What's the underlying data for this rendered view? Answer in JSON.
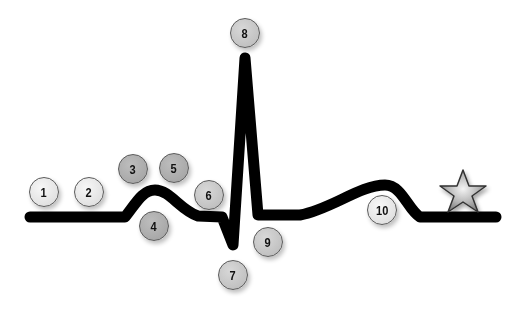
{
  "diagram": {
    "type": "ecg-waveform",
    "line_color": "#000000",
    "background": "#ffffff",
    "end_marker": {
      "icon": "star-icon",
      "fill": "#b8b8b8",
      "stroke": "#333333"
    },
    "markers": [
      {
        "label": "1",
        "tone": "light",
        "x": 29,
        "y": 177
      },
      {
        "label": "2",
        "tone": "light",
        "x": 74,
        "y": 177
      },
      {
        "label": "3",
        "tone": "dark",
        "x": 118,
        "y": 154
      },
      {
        "label": "4",
        "tone": "dark",
        "x": 139,
        "y": 211
      },
      {
        "label": "5",
        "tone": "dark",
        "x": 159,
        "y": 153
      },
      {
        "label": "6",
        "tone": "mid",
        "x": 194,
        "y": 180
      },
      {
        "label": "7",
        "tone": "mid",
        "x": 218,
        "y": 260
      },
      {
        "label": "8",
        "tone": "mid",
        "x": 230,
        "y": 18
      },
      {
        "label": "9",
        "tone": "mid",
        "x": 253,
        "y": 227
      },
      {
        "label": "10",
        "tone": "light",
        "x": 367,
        "y": 195
      }
    ]
  }
}
